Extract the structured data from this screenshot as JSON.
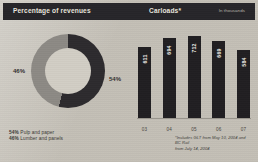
{
  "header": {
    "left_title": "Percentage of revenues",
    "mid_title": "Carloads*",
    "right_note": "In thousands"
  },
  "donut": {
    "label_left": "46%",
    "label_right": "54%",
    "legend": [
      {
        "pct": "54%",
        "name": "Pulp and paper"
      },
      {
        "pct": "46%",
        "name": "Lumber and panels"
      }
    ]
  },
  "bars": {
    "footnote_line1": "*Includes GLT from May 10, 2004 and BC Rail",
    "footnote_line2": "from July 14, 2004"
  },
  "colors": {
    "dark_segment": "#2d2b2e",
    "light_segment": "#8d8a85",
    "bar_fill": "#211f22",
    "band": "#27262a",
    "paper": "#d4d0c7"
  },
  "chart_data": [
    {
      "type": "pie",
      "title": "Percentage of revenues",
      "labels": [
        "Pulp and paper",
        "Lumber and panels"
      ],
      "values": [
        54,
        46
      ],
      "unit": "%",
      "donut": true,
      "legend_position": "bottom-left",
      "colors": [
        "#2d2b2e",
        "#8d8a85"
      ]
    },
    {
      "type": "bar",
      "title": "Carloads*",
      "subtitle": "In thousands",
      "categories": [
        "03",
        "04",
        "05",
        "06",
        "07"
      ],
      "values": [
        611,
        694,
        712,
        669,
        584
      ],
      "xlabel": "",
      "ylabel": "In thousands",
      "ylim": [
        0,
        760
      ],
      "grid": false,
      "value_labels": true,
      "annotations": [
        "*Includes GLT from May 10, 2004 and BC Rail from July 14, 2004"
      ]
    }
  ]
}
